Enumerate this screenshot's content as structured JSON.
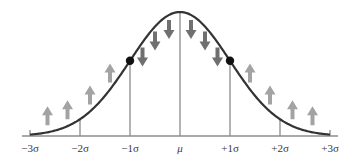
{
  "diagram": {
    "x_labels": [
      "−3σ",
      "−2σ",
      "−1σ",
      "μ",
      "+1σ",
      "+2σ",
      "+3σ"
    ],
    "x_values": [
      -3,
      -2,
      -1,
      0,
      1,
      2,
      3
    ],
    "inflection_points": [
      -1,
      1
    ],
    "arrows": {
      "up": [
        -2.65,
        -2.25,
        -1.8,
        -1.4,
        1.4,
        1.8,
        2.25,
        2.65
      ],
      "down": [
        -0.75,
        -0.5,
        -0.22,
        0.22,
        0.5,
        0.75
      ]
    },
    "colors": {
      "curve": "#333333",
      "axis": "#8c8c8c",
      "up_arrow": "#a3a3a3",
      "down_arrow": "#707070",
      "point": "#111111",
      "label": "#3a3a3a"
    }
  }
}
